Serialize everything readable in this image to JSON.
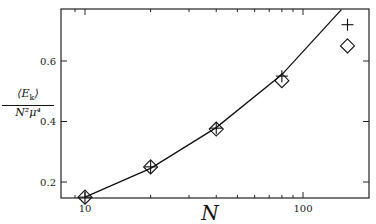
{
  "chart_data": {
    "type": "line",
    "title": "",
    "xlabel": "N",
    "ylabel": "<E_k> / (N^2 mu^4)",
    "ylabel_numerator": "⟨E",
    "ylabel_numerator_sub": "k",
    "ylabel_numerator_close": "⟩",
    "ylabel_denominator": "N²μ⁴",
    "xscale": "log",
    "xlim": [
      9,
      190
    ],
    "ylim": [
      0.147,
      0.77
    ],
    "xticks": [
      10,
      100
    ],
    "xtick_labels": [
      "10",
      "100"
    ],
    "yticks": [
      0.2,
      0.4,
      0.6
    ],
    "ytick_labels": [
      "0.2",
      "0.4",
      "0.6"
    ],
    "grid": false,
    "legend": null,
    "series": [
      {
        "name": "fit curve",
        "style": "line",
        "x": [
          10,
          20,
          40,
          80,
          150
        ],
        "values": [
          0.15,
          0.245,
          0.38,
          0.555,
          0.77
        ]
      },
      {
        "name": "plus markers",
        "style": "marker-plus",
        "x": [
          10,
          20,
          40,
          80,
          160
        ],
        "values": [
          0.15,
          0.25,
          0.378,
          0.55,
          0.72
        ]
      },
      {
        "name": "diamond markers",
        "style": "marker-diamond",
        "x": [
          10,
          20,
          40,
          80,
          160
        ],
        "values": [
          0.15,
          0.25,
          0.375,
          0.535,
          0.65
        ]
      }
    ]
  }
}
